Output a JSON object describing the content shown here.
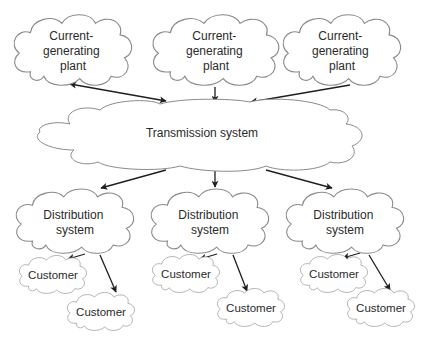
{
  "diagram": {
    "title": "",
    "nodes": {
      "plant_1": {
        "lines": [
          "Current-",
          "generating",
          "plant"
        ]
      },
      "plant_2": {
        "lines": [
          "Current-",
          "generating",
          "plant"
        ]
      },
      "plant_3": {
        "lines": [
          "Current-",
          "generating",
          "plant"
        ]
      },
      "transmission": {
        "lines": [
          "Transmission system"
        ]
      },
      "distribution_1": {
        "lines": [
          "Distribution",
          "system"
        ]
      },
      "distribution_2": {
        "lines": [
          "Distribution",
          "system"
        ]
      },
      "distribution_3": {
        "lines": [
          "Distribution",
          "system"
        ]
      },
      "customer_1a": {
        "lines": [
          "Customer"
        ]
      },
      "customer_1b": {
        "lines": [
          "Customer"
        ]
      },
      "customer_2a": {
        "lines": [
          "Customer"
        ]
      },
      "customer_2b": {
        "lines": [
          "Customer"
        ]
      },
      "customer_3a": {
        "lines": [
          "Customer"
        ]
      },
      "customer_3b": {
        "lines": [
          "Customer"
        ]
      }
    },
    "edges": [
      {
        "from": "plant_1",
        "to": "transmission",
        "bidirectional": true
      },
      {
        "from": "plant_2",
        "to": "transmission",
        "bidirectional": false
      },
      {
        "from": "plant_3",
        "to": "transmission",
        "bidirectional": false
      },
      {
        "from": "transmission",
        "to": "distribution_1",
        "bidirectional": false
      },
      {
        "from": "transmission",
        "to": "distribution_2",
        "bidirectional": false
      },
      {
        "from": "transmission",
        "to": "distribution_3",
        "bidirectional": false
      },
      {
        "from": "distribution_1",
        "to": "customer_1a",
        "bidirectional": false
      },
      {
        "from": "distribution_1",
        "to": "customer_1b",
        "bidirectional": false
      },
      {
        "from": "distribution_2",
        "to": "customer_2a",
        "bidirectional": false
      },
      {
        "from": "distribution_2",
        "to": "customer_2b",
        "bidirectional": false
      },
      {
        "from": "distribution_3",
        "to": "customer_3a",
        "bidirectional": false
      },
      {
        "from": "distribution_3",
        "to": "customer_3b",
        "bidirectional": false
      }
    ],
    "colors": {
      "cloud_stroke": "#8a8a8a",
      "arrow": "#1e1e1e",
      "text": "#2a2a2a",
      "background": "#ffffff"
    }
  }
}
